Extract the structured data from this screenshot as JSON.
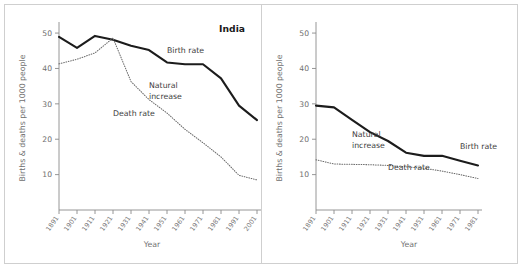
{
  "figure": {
    "background": "#ffffff",
    "border_color": "#cfcfcf",
    "axis_color": "#8a8a8a",
    "birth_color": "#1c1c1c",
    "death_color": "#6b6b6b"
  },
  "chart_data": [
    {
      "type": "line",
      "title": "India",
      "xlabel": "Year",
      "ylabel": "Births & deaths per 1000 people",
      "grid": false,
      "legend_position": "inline-annotations",
      "ylim": [
        0,
        52
      ],
      "yticks": [
        10,
        20,
        30,
        40,
        50
      ],
      "categories": [
        "1891",
        "1901",
        "1911",
        "1921",
        "1931",
        "1941",
        "1951",
        "1961",
        "1971",
        "1981",
        "1991",
        "2001"
      ],
      "annotations": [
        {
          "text": "Birth rate",
          "x": "1951",
          "y": 44.5
        },
        {
          "text": "Natural",
          "x": "1941",
          "y": 34.5
        },
        {
          "text": "increase",
          "x": "1941",
          "y": 31.5
        },
        {
          "text": "Death rate",
          "x": "1921",
          "y": 26.5
        }
      ],
      "series": [
        {
          "name": "Birth rate",
          "style": "solid",
          "values": [
            48.9,
            45.8,
            49.2,
            48.1,
            46.4,
            45.2,
            41.7,
            41.2,
            41.2,
            37.2,
            29.5,
            25.4
          ]
        },
        {
          "name": "Death rate",
          "style": "dotted",
          "values": [
            41.3,
            42.6,
            44.4,
            48.6,
            36.3,
            31.2,
            27.4,
            22.8,
            19.0,
            15.0,
            9.8,
            8.5
          ]
        }
      ]
    },
    {
      "type": "line",
      "title": "",
      "xlabel": "Year",
      "ylabel": "Births & deaths per 1000 people",
      "grid": false,
      "legend_position": "inline-annotations",
      "ylim": [
        0,
        52
      ],
      "yticks": [
        10,
        20,
        30,
        40,
        50
      ],
      "categories": [
        "1891",
        "1901",
        "1911",
        "1921",
        "1931",
        "1941",
        "1951",
        "1961",
        "1971",
        "1981"
      ],
      "annotations": [
        {
          "text": "Natural",
          "x": "1911",
          "y": 20.5
        },
        {
          "text": "increase",
          "x": "1911",
          "y": 17.5
        },
        {
          "text": "Birth rate",
          "x": "1971",
          "y": 17.3
        },
        {
          "text": "Death rate",
          "x": "1931",
          "y": 11.4
        }
      ],
      "series": [
        {
          "name": "Birth rate",
          "style": "solid",
          "values": [
            29.5,
            29.0,
            25.5,
            22.0,
            19.5,
            16.2,
            15.3,
            15.3,
            13.9,
            12.6
          ]
        },
        {
          "name": "Death rate",
          "style": "dotted",
          "values": [
            14.2,
            13.0,
            12.9,
            12.8,
            12.6,
            12.2,
            11.8,
            11.0,
            10.0,
            8.9
          ]
        }
      ]
    }
  ]
}
